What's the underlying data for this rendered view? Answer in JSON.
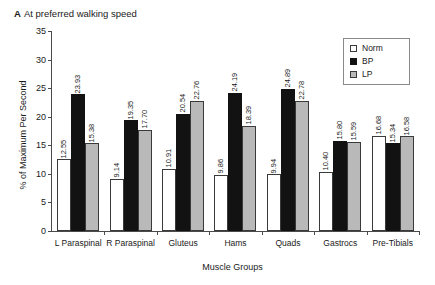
{
  "panel": {
    "letter": "A",
    "title": "At preferred walking speed"
  },
  "legend": {
    "position": "top-right",
    "entries": [
      {
        "label": "Norm",
        "key": "norm",
        "color": "#ffffff"
      },
      {
        "label": "BP",
        "key": "bp",
        "color": "#121212"
      },
      {
        "label": "LP",
        "key": "lp",
        "color": "#b9b9b9"
      }
    ]
  },
  "chart_data": {
    "type": "bar",
    "title": "At preferred walking speed",
    "xlabel": "Muscle Groups",
    "ylabel": "% of Maximum Per Second",
    "ylim": [
      0,
      35
    ],
    "yticks": [
      0,
      5,
      10,
      15,
      20,
      25,
      30,
      35
    ],
    "grid": false,
    "legend_position": "top-right",
    "categories": [
      "L Paraspinal",
      "R Paraspinal",
      "Gluteus",
      "Hams",
      "Quads",
      "Gastrocs",
      "Pre-Tibials"
    ],
    "series": [
      {
        "name": "Norm",
        "color": "#ffffff",
        "values": [
          12.55,
          9.14,
          10.91,
          9.86,
          9.94,
          10.4,
          16.68
        ],
        "labels": [
          "12.55",
          "9.14",
          "10.91",
          "9.86",
          "9.94",
          "10.40",
          "16.68"
        ]
      },
      {
        "name": "BP",
        "color": "#121212",
        "values": [
          23.93,
          19.35,
          20.54,
          24.19,
          24.89,
          15.8,
          15.34
        ],
        "labels": [
          "23.93",
          "19.35",
          "20.54",
          "24.19",
          "24.89",
          "15.80",
          "15.34"
        ]
      },
      {
        "name": "LP",
        "color": "#b9b9b9",
        "values": [
          15.38,
          17.7,
          22.76,
          18.39,
          22.78,
          15.59,
          16.58
        ],
        "labels": [
          "15.38",
          "17.70",
          "22.76",
          "18.39",
          "22.78",
          "15.59",
          "16.58"
        ]
      }
    ]
  }
}
